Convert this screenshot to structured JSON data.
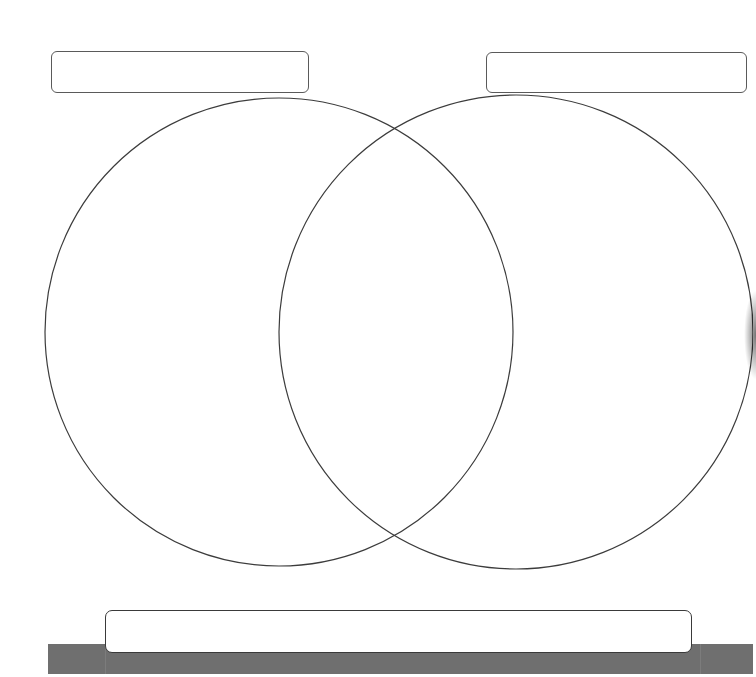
{
  "diagram": {
    "type": "venn",
    "circles": [
      {
        "name": "left-set",
        "cx": 279,
        "cy": 332,
        "r": 234,
        "stroke": "#3c3c3c",
        "label": ""
      },
      {
        "name": "right-set",
        "cx": 516,
        "cy": 332,
        "r": 237,
        "stroke": "#3c3c3c",
        "label": ""
      }
    ],
    "label_boxes": {
      "left_title": "",
      "right_title": "",
      "bottom_caption": ""
    },
    "colors": {
      "background": "#ffffff",
      "outline": "#3c3c3c",
      "bottom_bar": "#6f6f6f"
    }
  }
}
